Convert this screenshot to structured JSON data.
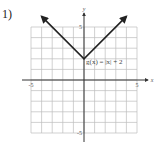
{
  "problem": {
    "number": "1)"
  },
  "chart_data": {
    "type": "line",
    "title": "",
    "xlabel": "x",
    "ylabel": "y",
    "xlim": [
      -5,
      5
    ],
    "ylim": [
      -5,
      5
    ],
    "grid": true,
    "tick_labels": {
      "x_min": "-5",
      "x_max": "5",
      "y_max": "5",
      "y_min": "-5"
    },
    "series": [
      {
        "name": "g(x) = |x| + 2",
        "function": "abs(x) + 2",
        "x": [
          -4,
          0,
          4
        ],
        "y": [
          6,
          2,
          6
        ],
        "arrows_at_ends": true
      }
    ],
    "annotations": [
      {
        "text": "g(x) = |x| + 2",
        "x": 0.2,
        "y": 1.5
      }
    ]
  }
}
